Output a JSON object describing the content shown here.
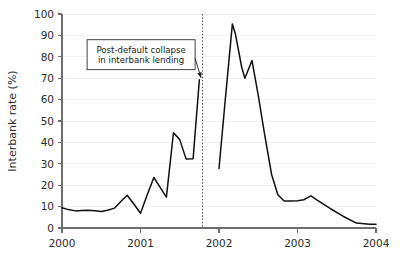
{
  "chart_data": {
    "type": "line",
    "title": "",
    "xlabel": "",
    "ylabel": "Interbank rate (%)",
    "xlim": [
      2000.0,
      2004.0
    ],
    "ylim": [
      0,
      100
    ],
    "grid": true,
    "legend_position": "none",
    "x_ticks": [
      2000,
      2001,
      2002,
      2003,
      2004
    ],
    "x_tick_labels": [
      "2000",
      "2001",
      "2002",
      "2003",
      "2004"
    ],
    "y_ticks": [
      0,
      10,
      20,
      30,
      40,
      50,
      60,
      70,
      80,
      90,
      100
    ],
    "y_tick_labels": [
      "0",
      "10",
      "20",
      "30",
      "40",
      "50",
      "60",
      "70",
      "80",
      "90",
      "100"
    ],
    "series": [
      {
        "name": "Interbank rate",
        "color": "#111111",
        "segments": [
          {
            "name": "pre-default",
            "x": [
              2000.0,
              2000.08,
              2000.17,
              2000.25,
              2000.33,
              2000.42,
              2000.5,
              2000.58,
              2000.67,
              2000.75,
              2000.83,
              2000.92,
              2001.0,
              2001.08,
              2001.17,
              2001.25,
              2001.33,
              2001.42,
              2001.5,
              2001.58,
              2001.67,
              2001.75
            ],
            "y": [
              9.5,
              8.6,
              8.0,
              8.2,
              8.3,
              8.1,
              7.7,
              8.3,
              9.3,
              12.4,
              15.3,
              11.0,
              6.9,
              15.0,
              23.6,
              19.0,
              14.4,
              44.5,
              41.3,
              32.3,
              32.4,
              69.3
            ]
          },
          {
            "name": "post-default",
            "x": [
              2002.0,
              2002.08,
              2002.17,
              2002.21,
              2002.29,
              2002.33,
              2002.42,
              2002.5,
              2002.58,
              2002.67,
              2002.75,
              2002.83,
              2002.92,
              2003.0,
              2003.08,
              2003.17,
              2003.25,
              2003.42,
              2003.58,
              2003.75,
              2003.92,
              2004.0
            ],
            "y": [
              27.8,
              60.0,
              95.3,
              90.5,
              75.0,
              70.0,
              78.3,
              62.0,
              44.0,
              25.0,
              15.5,
              12.6,
              12.6,
              12.7,
              13.2,
              15.0,
              13.0,
              9.0,
              5.5,
              2.3,
              1.8,
              1.8
            ]
          }
        ]
      }
    ],
    "event_markers": [
      {
        "name": "default-line",
        "x": 2001.79,
        "style": "dotted",
        "color": "#555555"
      }
    ],
    "annotations": [
      {
        "name": "post-default-collapse",
        "line1": "Post-default collapse",
        "line2": "in interbank lending",
        "target_x": 2001.79,
        "target_y": 69.3,
        "box_x": 2000.32,
        "box_y_top": 88,
        "box_y_bottom": 74
      }
    ]
  },
  "layout": {
    "plot_left": 62,
    "plot_right": 376,
    "plot_top": 14,
    "plot_bottom": 228
  }
}
